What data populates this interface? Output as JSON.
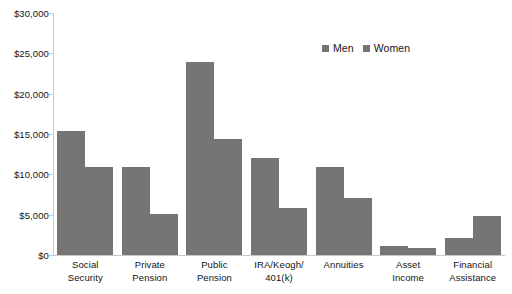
{
  "chart_data": {
    "type": "bar",
    "title": "",
    "xlabel": "",
    "ylabel": "",
    "ylim": [
      0,
      30000
    ],
    "ytick_step": 5000,
    "grid": false,
    "legend_position": "top-right",
    "bar_color": "#757575",
    "axis_color": "#c9c9c9",
    "categories": [
      "Social\nSecurity",
      "Private\nPension",
      "Public\nPension",
      "IRA/Keogh/\n401(k)",
      "Annuities",
      "Asset\nIncome",
      "Financial\nAssistance"
    ],
    "ytick_labels": [
      "$0",
      "$5,000",
      "$10,000",
      "$15,000",
      "$20,000",
      "$25,000",
      "$30,000"
    ],
    "ytick_values": [
      0,
      5000,
      10000,
      15000,
      20000,
      25000,
      30000
    ],
    "series": [
      {
        "name": "Men",
        "color": "#757575",
        "values": [
          15400,
          10900,
          23900,
          12000,
          10900,
          1100,
          2100
        ]
      },
      {
        "name": "Women",
        "color": "#757575",
        "values": [
          10950,
          5100,
          14400,
          5800,
          7100,
          900,
          4800
        ]
      }
    ]
  },
  "legend": {
    "items": [
      {
        "label": "Men",
        "color": "#757575"
      },
      {
        "label": "Women",
        "color": "#757575"
      }
    ]
  }
}
